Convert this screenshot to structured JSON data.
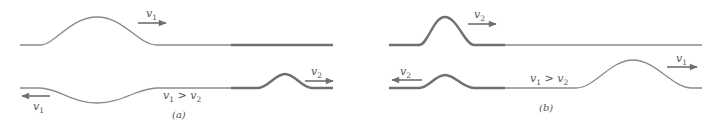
{
  "figure": {
    "panels": [
      {
        "id": "a",
        "caption": "(a)",
        "before": {
          "pulse_velocity_label": {
            "symbol": "v",
            "subscript": "1"
          },
          "pulse_direction": "right",
          "pulse_on": "thin string"
        },
        "after": {
          "reflected": {
            "symbol": "v",
            "subscript": "1",
            "direction": "left",
            "inverted": true
          },
          "transmitted": {
            "symbol": "v",
            "subscript": "2",
            "direction": "right",
            "inverted": false
          },
          "relation": {
            "lhs": "v",
            "lhs_sub": "1",
            "op": " > ",
            "rhs": "v",
            "rhs_sub": "2"
          }
        }
      },
      {
        "id": "b",
        "caption": "(b)",
        "before": {
          "pulse_velocity_label": {
            "symbol": "v",
            "subscript": "2"
          },
          "pulse_direction": "right",
          "pulse_on": "thick string"
        },
        "after": {
          "reflected": {
            "symbol": "v",
            "subscript": "2",
            "direction": "left",
            "inverted": false
          },
          "transmitted": {
            "symbol": "v",
            "subscript": "1",
            "direction": "right",
            "inverted": false
          },
          "relation": {
            "lhs": "v",
            "lhs_sub": "1",
            "op": " > ",
            "rhs": "v",
            "rhs_sub": "2"
          }
        }
      }
    ],
    "colors": {
      "thin_string": "#8a8a8a",
      "thick_string": "#707070",
      "text": "#555555"
    }
  }
}
